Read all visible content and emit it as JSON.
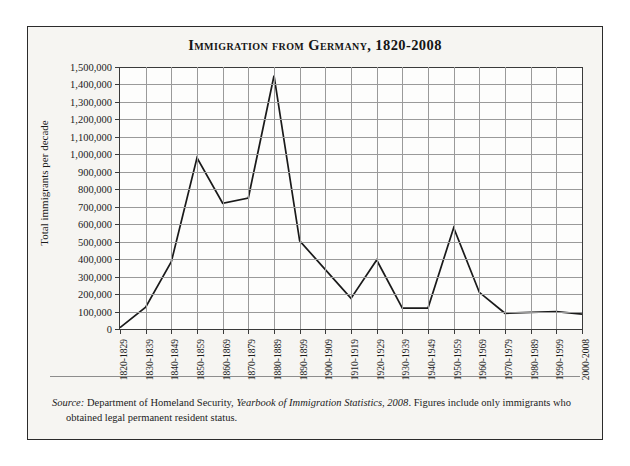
{
  "figure": {
    "title": "Immigration from Germany, 1820-2008",
    "y_axis_title": "Total immigrants per decade",
    "source": {
      "lead": "Source:",
      "text_before_work": " Department of Homeland Security, ",
      "work": "Yearbook of Immigration Statistics, 2008",
      "text_after_work": ". Figures include only immigrants who",
      "continuation": "obtained legal permanent resident status."
    }
  },
  "chart_data": {
    "type": "line",
    "title": "Immigration from Germany, 1820-2008",
    "xlabel": "",
    "ylabel": "Total immigrants per decade",
    "ylim": [
      0,
      1500000
    ],
    "ytick_step": 100000,
    "grid": true,
    "legend": "none",
    "line_color": "#1a1a1a",
    "categories": [
      "1820-1829",
      "1830-1839",
      "1840-1849",
      "1850-1859",
      "1860-1869",
      "1870-1879",
      "1880-1889",
      "1890-1899",
      "1900-1909",
      "1910-1919",
      "1920-1929",
      "1930-1939",
      "1940-1949",
      "1950-1959",
      "1960-1969",
      "1970-1979",
      "1980-1989",
      "1990-1999",
      "2000-2008"
    ],
    "values": [
      8000,
      125000,
      385000,
      980000,
      720000,
      750000,
      1450000,
      505000,
      340000,
      175000,
      395000,
      120000,
      120000,
      580000,
      210000,
      90000,
      95000,
      100000,
      85000
    ],
    "ytick_labels": [
      "1,500,000",
      "1,400,000",
      "1,300,000",
      "1,200,000",
      "1,100,000",
      "1,000,000",
      "900,000",
      "800,000",
      "700,000",
      "600,000",
      "500,000",
      "400,000",
      "300,000",
      "200,000",
      "100,000",
      "0"
    ]
  }
}
